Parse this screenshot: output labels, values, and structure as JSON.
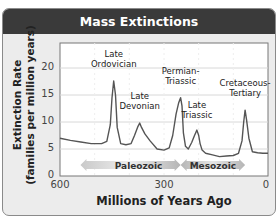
{
  "title": "Mass Extinctions",
  "chart_data": {
    "type": "line",
    "title": "Mass Extinctions",
    "xlabel": "Millions of Years Ago",
    "ylabel": "Extinction Rate (families per million years)",
    "ylabel_lines": [
      "Extinction  Rate",
      "(families per million years)"
    ],
    "xlim": [
      600,
      0
    ],
    "ylim": [
      0,
      24
    ],
    "x_ticks": [
      600,
      300,
      0
    ],
    "y_ticks": [
      0,
      5,
      10,
      15,
      20
    ],
    "grid": true,
    "series": [
      {
        "name": "Extinction rate",
        "color": "#555555",
        "x": [
          600,
          570,
          540,
          510,
          480,
          465,
          455,
          450,
          445,
          440,
          435,
          425,
          410,
          395,
          385,
          375,
          370,
          365,
          355,
          340,
          320,
          300,
          285,
          275,
          265,
          258,
          252,
          248,
          244,
          238,
          230,
          220,
          212,
          205,
          200,
          196,
          190,
          180,
          160,
          140,
          120,
          100,
          85,
          75,
          70,
          66,
          62,
          55,
          45,
          30,
          15,
          0
        ],
        "y": [
          7.0,
          6.6,
          6.3,
          6.0,
          6.0,
          6.4,
          9.5,
          14.5,
          17.6,
          15.0,
          9.0,
          6.0,
          5.8,
          6.0,
          7.5,
          9.2,
          9.8,
          9.0,
          7.8,
          6.5,
          5.0,
          4.8,
          5.2,
          7.5,
          11.5,
          13.5,
          14.5,
          13.0,
          8.0,
          5.5,
          5.0,
          6.2,
          7.5,
          8.5,
          7.5,
          6.0,
          4.8,
          4.2,
          3.9,
          3.6,
          3.7,
          3.8,
          4.2,
          6.5,
          10.0,
          12.2,
          10.5,
          7.0,
          4.5,
          4.3,
          4.2,
          4.2
        ]
      }
    ],
    "annotations": [
      {
        "label": "Late Ordovician",
        "lines": [
          "Late",
          "Ordovician"
        ],
        "x": 445,
        "y": 17.6
      },
      {
        "label": "Late Devonian",
        "lines": [
          "Late",
          "Devonian"
        ],
        "x": 370,
        "y": 9.8
      },
      {
        "label": "Permian-Triassic",
        "lines": [
          "Permian-",
          "Triassic"
        ],
        "x": 252,
        "y": 14.5
      },
      {
        "label": "Late Triassic",
        "lines": [
          "Late",
          "Triassic"
        ],
        "x": 205,
        "y": 8.5
      },
      {
        "label": "Cretaceous-Tertiary",
        "lines": [
          "Cretaceous-",
          "Tertiary"
        ],
        "x": 66,
        "y": 12.2
      }
    ],
    "era_bands": [
      {
        "label": "Paleozoic",
        "from": 541,
        "to": 252
      },
      {
        "label": "Mesozoic",
        "from": 252,
        "to": 66
      }
    ]
  },
  "colors": {
    "title_bar": "#3a3a3a",
    "frame_bg": "#ececec",
    "plot_bg": "#ffffff",
    "line": "#555555",
    "grid": "#d8d8d8",
    "era_arrow": "#b8b8b8"
  }
}
